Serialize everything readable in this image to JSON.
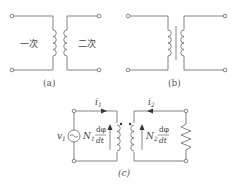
{
  "diagram": {
    "panel_a": {
      "caption": "(a)",
      "primary_label": "一次",
      "secondary_label": "二次"
    },
    "panel_b": {
      "caption": "(b)"
    },
    "panel_c": {
      "caption": "(c)",
      "current_primary": "i",
      "current_primary_sub": "1",
      "current_secondary": "i",
      "current_secondary_sub": "2",
      "source_label": "v",
      "source_sub": "1",
      "emf_primary_N": "N",
      "emf_primary_sub": "1",
      "emf_secondary_N": "N",
      "emf_secondary_sub": "2",
      "deriv_num": "dφ",
      "deriv_den": "dt"
    },
    "colors": {
      "line": "#555555",
      "text": "#444444"
    }
  }
}
